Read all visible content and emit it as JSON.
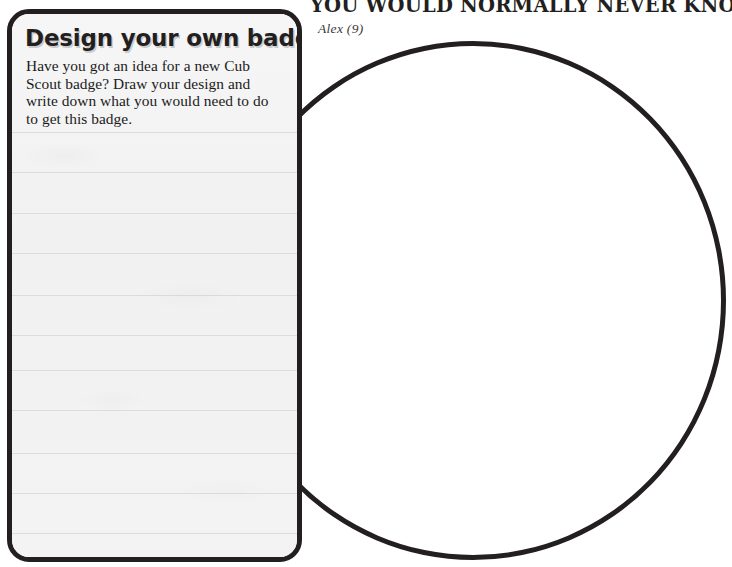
{
  "page": {
    "background_color": "#ffffff",
    "ink_color": "#231f20"
  },
  "quote": {
    "title": "YOU WOULD NORMALLY NEVER KNOW.’",
    "attribution": "Alex (9)"
  },
  "badge_panel": {
    "heading": "Design your own badge",
    "body": "Have you got an idea for a new Cub Scout badge? Draw your design and write down what you would need to do to get this badge.",
    "fill_color": "#f4f4f4",
    "border_color": "#231f20",
    "rule_line_color": "#dcdcdc",
    "rule_line_tops": [
      118,
      158,
      199,
      239,
      281,
      321,
      356,
      396,
      439,
      479,
      519
    ],
    "rule_line_count": 11
  },
  "drawing_circle": {
    "label": "drawing-area",
    "border_color": "#231f20",
    "fill_color": "#ffffff",
    "border_width_px": 5,
    "diameter_px": 506
  }
}
